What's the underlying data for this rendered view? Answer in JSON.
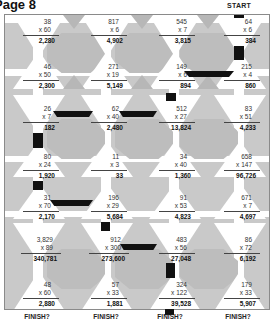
{
  "page": {
    "title": "Page 8",
    "start_label": "START",
    "finish_label": "FINISH?"
  },
  "grid": {
    "columns": 4,
    "rows": 7,
    "problems": [
      [
        {
          "a": "38",
          "b": "x 60",
          "result": "2,280"
        },
        {
          "a": "817",
          "b": "x 6",
          "result": "4,902"
        },
        {
          "a": "545",
          "b": "x 7",
          "result": "3,815"
        },
        {
          "a": "64",
          "b": "x 6",
          "result": "384"
        }
      ],
      [
        {
          "a": "46",
          "b": "x 50",
          "result": "2,300"
        },
        {
          "a": "271",
          "b": "x 19",
          "result": "5,149"
        },
        {
          "a": "149",
          "b": "x 6",
          "result": "894"
        },
        {
          "a": "215",
          "b": "x 4",
          "result": "860"
        }
      ],
      [
        {
          "a": "26",
          "b": "x 7",
          "result": "182"
        },
        {
          "a": "62",
          "b": "x 40",
          "result": "2,480"
        },
        {
          "a": "512",
          "b": "x 27",
          "result": "13,824"
        },
        {
          "a": "83",
          "b": "x 51",
          "result": "4,233"
        }
      ],
      [
        {
          "a": "80",
          "b": "x 24",
          "result": "1,920"
        },
        {
          "a": "11",
          "b": "x 3",
          "result": "33"
        },
        {
          "a": "34",
          "b": "x 40",
          "result": "1,360"
        },
        {
          "a": "658",
          "b": "x 147",
          "result": "96,726"
        }
      ],
      [
        {
          "a": "31",
          "b": "x 70",
          "result": "2,170"
        },
        {
          "a": "196",
          "b": "x 29",
          "result": "5,684"
        },
        {
          "a": "91",
          "b": "x 53",
          "result": "4,823"
        },
        {
          "a": "671",
          "b": "x 7",
          "result": "4,697"
        }
      ],
      [
        {
          "a": "3,829",
          "b": "x 89",
          "result": "340,781"
        },
        {
          "a": "912",
          "b": "x 300",
          "result": "273,600"
        },
        {
          "a": "483",
          "b": "x 56",
          "result": "27,048"
        },
        {
          "a": "86",
          "b": "x 72",
          "result": "6,192"
        }
      ],
      [
        {
          "a": "48",
          "b": "x 60",
          "result": "2,880"
        },
        {
          "a": "57",
          "b": "x 33",
          "result": "1,881"
        },
        {
          "a": "324",
          "b": "x 122",
          "result": "39,528"
        },
        {
          "a": "179",
          "b": "x 33",
          "result": "5,907"
        }
      ]
    ]
  },
  "finish_labels": [
    "FINISH?",
    "FINISH?",
    "FINISH?",
    "FINISH?"
  ],
  "colors": {
    "background": "#c9c9c9",
    "cell": "#ffffff",
    "path": "#111111",
    "hexagon": "#bdbdbd"
  }
}
